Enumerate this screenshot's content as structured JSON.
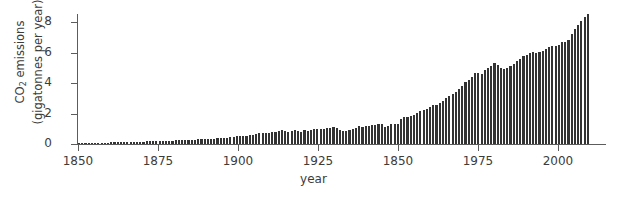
{
  "figure": {
    "background": "#ffffff",
    "bar_color": "#333333",
    "axis_color": "#5c5c5c",
    "text_color": "#3c3c3c"
  },
  "axes": {
    "ylabel_line1": "CO",
    "ylabel_sub": "2",
    "ylabel_line1_rest": " emissions",
    "ylabel_line2": "(gigatonnes per year)",
    "xlabel": "year",
    "yticks": [
      "0",
      "2",
      "4",
      "6",
      "8"
    ],
    "xticks": [
      "1850",
      "1875",
      "1900",
      "1925",
      "1850",
      "1975",
      "2000"
    ]
  },
  "chart_data": {
    "type": "bar",
    "title": "",
    "xlabel": "year",
    "ylabel": "CO2 emissions (gigatonnes per year)",
    "xlim": [
      1850,
      2009
    ],
    "ylim": [
      0,
      8.8
    ],
    "ytick_values": [
      0,
      2,
      4,
      6,
      8
    ],
    "xtick_positions": [
      1850,
      1875,
      1900,
      1925,
      1950,
      1975,
      2000
    ],
    "xtick_labels": [
      "1850",
      "1875",
      "1900",
      "1925",
      "1850",
      "1975",
      "2000"
    ],
    "grid": false,
    "legend": null,
    "note": "X tick normally expected to read 1950 is printed as 1850 in the source image.",
    "x": [
      1850,
      1851,
      1852,
      1853,
      1854,
      1855,
      1856,
      1857,
      1858,
      1859,
      1860,
      1861,
      1862,
      1863,
      1864,
      1865,
      1866,
      1867,
      1868,
      1869,
      1870,
      1871,
      1872,
      1873,
      1874,
      1875,
      1876,
      1877,
      1878,
      1879,
      1880,
      1881,
      1882,
      1883,
      1884,
      1885,
      1886,
      1887,
      1888,
      1889,
      1890,
      1891,
      1892,
      1893,
      1894,
      1895,
      1896,
      1897,
      1898,
      1899,
      1900,
      1901,
      1902,
      1903,
      1904,
      1905,
      1906,
      1907,
      1908,
      1909,
      1910,
      1911,
      1912,
      1913,
      1914,
      1915,
      1916,
      1917,
      1918,
      1919,
      1920,
      1921,
      1922,
      1923,
      1924,
      1925,
      1926,
      1927,
      1928,
      1929,
      1930,
      1931,
      1932,
      1933,
      1934,
      1935,
      1936,
      1937,
      1938,
      1939,
      1940,
      1941,
      1942,
      1943,
      1944,
      1945,
      1946,
      1947,
      1948,
      1949,
      1950,
      1951,
      1952,
      1953,
      1954,
      1955,
      1956,
      1957,
      1958,
      1959,
      1960,
      1961,
      1962,
      1963,
      1964,
      1965,
      1966,
      1967,
      1968,
      1969,
      1970,
      1971,
      1972,
      1973,
      1974,
      1975,
      1976,
      1977,
      1978,
      1979,
      1980,
      1981,
      1982,
      1983,
      1984,
      1985,
      1986,
      1987,
      1988,
      1989,
      1990,
      1991,
      1992,
      1993,
      1994,
      1995,
      1996,
      1997,
      1998,
      1999,
      2000,
      2001,
      2002,
      2003,
      2004,
      2005,
      2006,
      2007,
      2008
    ],
    "values": [
      0.05,
      0.05,
      0.06,
      0.06,
      0.07,
      0.07,
      0.08,
      0.08,
      0.09,
      0.09,
      0.1,
      0.1,
      0.1,
      0.11,
      0.12,
      0.12,
      0.13,
      0.13,
      0.14,
      0.15,
      0.15,
      0.17,
      0.18,
      0.19,
      0.18,
      0.2,
      0.2,
      0.2,
      0.2,
      0.22,
      0.24,
      0.24,
      0.26,
      0.28,
      0.28,
      0.28,
      0.29,
      0.3,
      0.32,
      0.33,
      0.35,
      0.36,
      0.36,
      0.37,
      0.39,
      0.41,
      0.42,
      0.44,
      0.47,
      0.5,
      0.53,
      0.54,
      0.55,
      0.59,
      0.59,
      0.64,
      0.69,
      0.74,
      0.72,
      0.75,
      0.79,
      0.8,
      0.84,
      0.9,
      0.85,
      0.82,
      0.88,
      0.91,
      0.87,
      0.79,
      0.94,
      0.84,
      0.9,
      1.01,
      0.96,
      1.0,
      0.98,
      1.07,
      1.08,
      1.14,
      1.06,
      0.94,
      0.84,
      0.87,
      0.94,
      0.99,
      1.08,
      1.15,
      1.1,
      1.15,
      1.2,
      1.22,
      1.25,
      1.29,
      1.31,
      1.11,
      1.18,
      1.29,
      1.33,
      1.31,
      1.63,
      1.77,
      1.79,
      1.84,
      1.87,
      2.04,
      2.16,
      2.25,
      2.31,
      2.41,
      2.54,
      2.57,
      2.69,
      2.83,
      2.99,
      3.12,
      3.28,
      3.39,
      3.58,
      3.83,
      4.05,
      4.21,
      4.39,
      4.66,
      4.64,
      4.6,
      4.88,
      4.99,
      5.09,
      5.3,
      5.16,
      4.99,
      4.93,
      4.97,
      5.14,
      5.27,
      5.46,
      5.58,
      5.78,
      5.84,
      5.97,
      6.03,
      5.99,
      6.01,
      6.07,
      6.2,
      6.39,
      6.44,
      6.42,
      6.46,
      6.68,
      6.72,
      6.85,
      7.21,
      7.55,
      7.83,
      8.09,
      8.36,
      8.53
    ]
  }
}
